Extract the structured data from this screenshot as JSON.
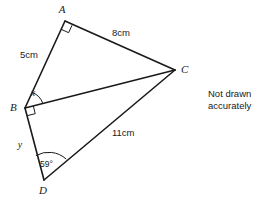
{
  "figure": {
    "type": "geometry-diagram",
    "stroke_color": "#1a1a1a",
    "background_color": "#ffffff",
    "vertices": [
      {
        "id": "A",
        "label": "A",
        "x": 65,
        "y": 21,
        "label_x": 62,
        "label_y": 13
      },
      {
        "id": "B",
        "label": "B",
        "x": 25,
        "y": 108,
        "label_x": 10,
        "label_y": 111
      },
      {
        "id": "C",
        "label": "C",
        "x": 175,
        "y": 70,
        "label_x": 181,
        "label_y": 73
      },
      {
        "id": "D",
        "label": "D",
        "x": 44,
        "y": 180,
        "label_x": 39,
        "label_y": 194
      }
    ],
    "edges": [
      {
        "id": "AB",
        "from": "A",
        "to": "B",
        "length_label": "5cm",
        "label_x": 20,
        "label_y": 58
      },
      {
        "id": "AC",
        "from": "A",
        "to": "C",
        "length_label": "8cm",
        "label_x": 112,
        "label_y": 36
      },
      {
        "id": "BC",
        "from": "B",
        "to": "C",
        "length_label": "",
        "label_x": 0,
        "label_y": 0
      },
      {
        "id": "BD",
        "from": "B",
        "to": "D",
        "length_label": "",
        "label_x": 0,
        "label_y": 0
      },
      {
        "id": "DC",
        "from": "D",
        "to": "C",
        "length_label": "11cm",
        "label_x": 112,
        "label_y": 136
      }
    ],
    "angles": [
      {
        "id": "angle-A",
        "at": "A",
        "marker": "right-angle",
        "label": "",
        "label_x": 0,
        "label_y": 0
      },
      {
        "id": "angle-x",
        "at": "B",
        "marker": "arc",
        "label": "x",
        "label_x": 33,
        "label_y": 96
      },
      {
        "id": "angle-B-right",
        "at": "B",
        "marker": "right-angle",
        "label": "",
        "label_x": 0,
        "label_y": 0
      },
      {
        "id": "angle-y",
        "at": "B",
        "marker": "none",
        "label": "y",
        "label_x": 20,
        "label_y": 148
      },
      {
        "id": "angle-D",
        "at": "D",
        "marker": "arc",
        "label": "59°",
        "label_x": 40,
        "label_y": 167
      }
    ]
  },
  "note": {
    "line_1": "Not drawn",
    "line_2": "accurately"
  }
}
